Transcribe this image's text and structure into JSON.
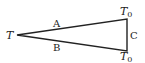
{
  "diagram": {
    "type": "triangle",
    "vertices": {
      "left": {
        "label": "T"
      },
      "top_right": {
        "label": "T",
        "subscript": "0"
      },
      "bottom_right": {
        "label": "T",
        "subscript": "0"
      }
    },
    "edges": {
      "top": {
        "label": "A"
      },
      "bottom": {
        "label": "B"
      },
      "right": {
        "label": "C"
      }
    },
    "colors": {
      "stroke": "#222222",
      "background": "#ffffff"
    }
  }
}
